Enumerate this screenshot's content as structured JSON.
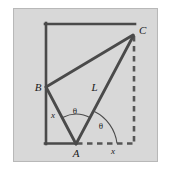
{
  "figure": {
    "background_color": "#ffffff",
    "panel_color": "#d6d6d6",
    "panel_border_color": "#b9b9b9",
    "stroke_color": "#4a4a4a",
    "dash_color": "#555555",
    "label_color": "#1a1a1a",
    "panel": {
      "x": 13,
      "y": 8,
      "width": 145,
      "height": 154
    },
    "points": {
      "A": {
        "x": 76,
        "y": 144,
        "label": "A"
      },
      "B": {
        "x": 46,
        "y": 87,
        "label": "B"
      },
      "C": {
        "x": 134,
        "y": 35,
        "label": "C"
      }
    },
    "segment_labels": {
      "hypotenuse": "L",
      "left_side": "x",
      "base_right": "x"
    },
    "angle_labels": {
      "angle_BAC": "θ",
      "angle_CA_base": "θ"
    },
    "rectangle": {
      "left": 46,
      "top": 24,
      "right": 134,
      "bottom": 144,
      "solid_edges": [
        "left",
        "top",
        "bottom-left-partial"
      ],
      "dashed_edges": [
        "right",
        "bottom-right-partial"
      ]
    },
    "lines": [
      {
        "name": "B-C",
        "from": "B",
        "to": "C",
        "style": "solid"
      },
      {
        "name": "A-B",
        "from": "A",
        "to": "B",
        "style": "solid"
      },
      {
        "name": "A-C",
        "from": "A",
        "to": "C",
        "style": "solid"
      }
    ]
  }
}
